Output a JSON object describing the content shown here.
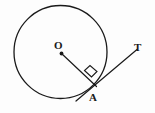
{
  "figure": {
    "name": "circle-tangent-radius-diagram",
    "background_color": "#fdfdfd",
    "stroke_color": "#1a1a1a",
    "width": 155,
    "height": 113
  },
  "labels": {
    "center": "O",
    "tangent_point": "A",
    "tangent_end": "T"
  },
  "geometry": {
    "circle": {
      "name": "main-circle",
      "cx": 60.5,
      "cy": 52,
      "r": 46.5,
      "stroke_width": 1.3
    },
    "center_dot": {
      "name": "center-point-O",
      "cx": 61.5,
      "cy": 53.5,
      "r": 1.9
    },
    "radius_segment": {
      "name": "radius-O-to-A",
      "x1": 61.5,
      "y1": 53.5,
      "x2": 96.5,
      "y2": 86.5,
      "stroke_width": 1.2
    },
    "tangent_segment": {
      "name": "tangent-line-through-A",
      "x1": 76,
      "y1": 101,
      "x2": 137,
      "y2": 49.5,
      "stroke_width": 1.2
    },
    "right_angle_marker": {
      "name": "right-angle-square-at-A",
      "points": "84.5,70.5 91.5,77 97,71.5 90,65.5",
      "stroke_width": 1.1
    }
  }
}
